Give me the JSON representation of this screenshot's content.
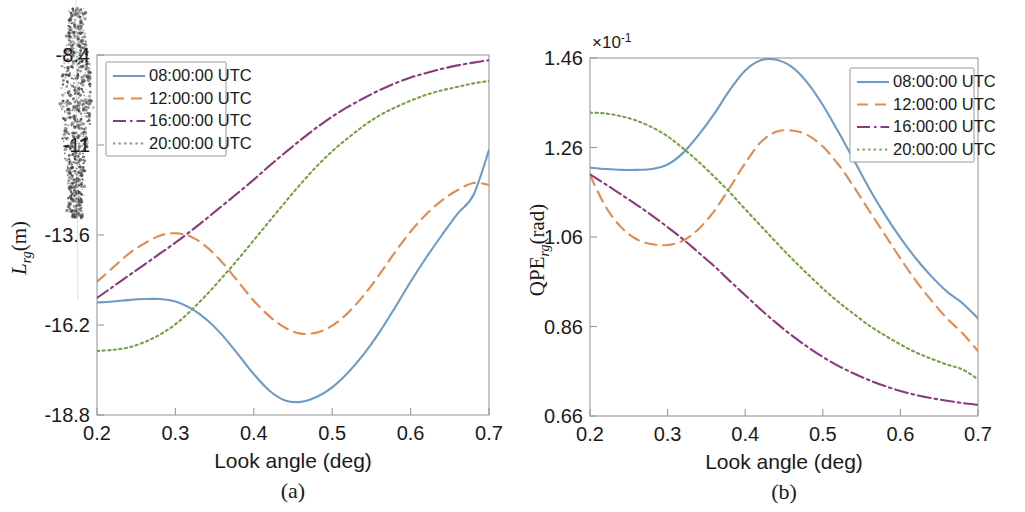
{
  "figure": {
    "type": "two-panel-line-chart",
    "background": "#ffffff",
    "panel_labels": {
      "a": "(a)",
      "b": "(b)"
    },
    "series_colors": {
      "08:00:00 UTC": "#6E9BC5",
      "12:00:00 UTC": "#E08B50",
      "16:00:00 UTC": "#8B3A7E",
      "20:00:00 UTC": "#76A046"
    },
    "series_styles": {
      "08:00:00 UTC": "solid",
      "12:00:00 UTC": "dashed",
      "16:00:00 UTC": "dash-dot",
      "20:00:00 UTC": "dotted"
    },
    "scan_artifact": "vertical-speckle-smudge"
  },
  "legend": {
    "entries": [
      "08:00:00 UTC",
      "12:00:00 UTC",
      "16:00:00 UTC",
      "20:00:00 UTC"
    ],
    "position_a": "top-left",
    "position_b": "top-right"
  },
  "chart_data": [
    {
      "panel": "(a)",
      "type": "line",
      "title": "",
      "xlabel": "Look angle (deg)",
      "ylabel": "L_rg (m)",
      "ylabel_parts": {
        "base": "L",
        "sub": "rg",
        "unit": "(m)"
      },
      "xlim": [
        0.2,
        0.7
      ],
      "ylim": [
        -18.8,
        -8.4
      ],
      "xticks": [
        0.2,
        0.3,
        0.4,
        0.5,
        0.6,
        0.7
      ],
      "xticklabels": [
        "0.2",
        "0.3",
        "0.4",
        "0.5",
        "0.6",
        "0.7"
      ],
      "yticks": [
        -18.8,
        -16.2,
        -13.6,
        -11,
        -8.4
      ],
      "yticklabels": [
        "-18.8",
        "-16.2",
        "-13.6",
        "-11",
        "-8.4"
      ],
      "y_multiplier": "",
      "grid": false,
      "legend_position": "top-left",
      "x": [
        0.2,
        0.22,
        0.24,
        0.26,
        0.28,
        0.3,
        0.32,
        0.34,
        0.36,
        0.38,
        0.4,
        0.42,
        0.44,
        0.46,
        0.48,
        0.5,
        0.52,
        0.54,
        0.56,
        0.58,
        0.6,
        0.62,
        0.64,
        0.66,
        0.68,
        0.7
      ],
      "series": [
        {
          "name": "08:00:00 UTC",
          "values": [
            -15.55,
            -15.52,
            -15.48,
            -15.45,
            -15.45,
            -15.52,
            -15.72,
            -16.05,
            -16.5,
            -17.05,
            -17.62,
            -18.1,
            -18.38,
            -18.42,
            -18.28,
            -18.0,
            -17.58,
            -17.05,
            -16.42,
            -15.7,
            -14.95,
            -14.25,
            -13.6,
            -12.98,
            -12.45,
            -11.15
          ]
        },
        {
          "name": "12:00:00 UTC",
          "values": [
            -14.95,
            -14.55,
            -14.15,
            -13.85,
            -13.62,
            -13.55,
            -13.65,
            -13.95,
            -14.4,
            -14.95,
            -15.5,
            -15.95,
            -16.28,
            -16.45,
            -16.42,
            -16.22,
            -15.85,
            -15.35,
            -14.75,
            -14.1,
            -13.5,
            -13.0,
            -12.6,
            -12.3,
            -12.1,
            -12.15
          ]
        },
        {
          "name": "16:00:00 UTC",
          "values": [
            -15.42,
            -15.1,
            -14.78,
            -14.46,
            -14.14,
            -13.82,
            -13.48,
            -13.12,
            -12.75,
            -12.38,
            -12.0,
            -11.6,
            -11.22,
            -10.85,
            -10.5,
            -10.18,
            -9.9,
            -9.65,
            -9.42,
            -9.22,
            -9.05,
            -8.92,
            -8.8,
            -8.7,
            -8.62,
            -8.55
          ]
        },
        {
          "name": "20:00:00 UTC",
          "values": [
            -16.95,
            -16.92,
            -16.85,
            -16.7,
            -16.48,
            -16.18,
            -15.78,
            -15.32,
            -14.82,
            -14.3,
            -13.75,
            -13.2,
            -12.65,
            -12.12,
            -11.62,
            -11.18,
            -10.8,
            -10.45,
            -10.15,
            -9.92,
            -9.72,
            -9.55,
            -9.42,
            -9.32,
            -9.22,
            -9.15
          ]
        }
      ]
    },
    {
      "panel": "(b)",
      "type": "line",
      "title": "",
      "xlabel": "Look angle (deg)",
      "ylabel": "QPE_rg (rad)",
      "ylabel_parts": {
        "base": "QPE",
        "sub": "rg",
        "unit": "(rad)"
      },
      "xlim": [
        0.2,
        0.7
      ],
      "ylim": [
        0.66,
        1.46
      ],
      "xticks": [
        0.2,
        0.3,
        0.4,
        0.5,
        0.6,
        0.7
      ],
      "xticklabels": [
        "0.2",
        "0.3",
        "0.4",
        "0.5",
        "0.6",
        "0.7"
      ],
      "yticks": [
        0.66,
        0.86,
        1.06,
        1.26,
        1.46
      ],
      "yticklabels": [
        "0.66",
        "0.86",
        "1.06",
        "1.26",
        "1.46"
      ],
      "y_multiplier": "×10⁻¹",
      "y_multiplier_base": "×10",
      "y_multiplier_exp": "-1",
      "grid": false,
      "legend_position": "top-right",
      "x": [
        0.2,
        0.22,
        0.24,
        0.26,
        0.28,
        0.3,
        0.32,
        0.34,
        0.36,
        0.38,
        0.4,
        0.42,
        0.44,
        0.46,
        0.48,
        0.5,
        0.52,
        0.54,
        0.56,
        0.58,
        0.6,
        0.62,
        0.64,
        0.66,
        0.68,
        0.7
      ],
      "series": [
        {
          "name": "08:00:00 UTC",
          "values": [
            1.215,
            1.212,
            1.21,
            1.21,
            1.212,
            1.222,
            1.248,
            1.288,
            1.335,
            1.388,
            1.432,
            1.455,
            1.456,
            1.44,
            1.405,
            1.355,
            1.295,
            1.232,
            1.168,
            1.11,
            1.058,
            1.012,
            0.972,
            0.938,
            0.912,
            0.878
          ]
        },
        {
          "name": "12:00:00 UTC",
          "values": [
            1.198,
            1.128,
            1.082,
            1.055,
            1.044,
            1.042,
            1.052,
            1.078,
            1.118,
            1.17,
            1.225,
            1.272,
            1.295,
            1.298,
            1.288,
            1.262,
            1.222,
            1.172,
            1.118,
            1.065,
            1.012,
            0.962,
            0.918,
            0.878,
            0.845,
            0.805
          ]
        },
        {
          "name": "16:00:00 UTC",
          "values": [
            1.2,
            1.178,
            1.155,
            1.132,
            1.108,
            1.082,
            1.055,
            1.025,
            0.995,
            0.962,
            0.93,
            0.898,
            0.868,
            0.84,
            0.815,
            0.792,
            0.772,
            0.755,
            0.74,
            0.727,
            0.716,
            0.707,
            0.7,
            0.694,
            0.689,
            0.685
          ]
        },
        {
          "name": "20:00:00 UTC",
          "values": [
            1.338,
            1.336,
            1.33,
            1.32,
            1.305,
            1.285,
            1.258,
            1.228,
            1.195,
            1.16,
            1.122,
            1.085,
            1.048,
            1.012,
            0.978,
            0.945,
            0.915,
            0.888,
            0.862,
            0.84,
            0.82,
            0.802,
            0.788,
            0.775,
            0.764,
            0.742
          ]
        }
      ]
    }
  ]
}
